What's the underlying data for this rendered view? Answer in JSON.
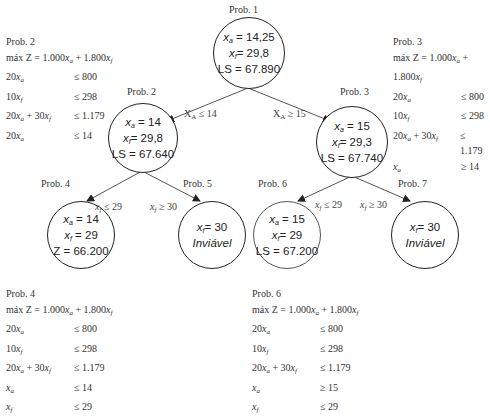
{
  "diagram": {
    "type": "branch-and-bound tree",
    "nodes": [
      {
        "id": "p1",
        "label": "Prob. 1",
        "lines": [
          "x_a = 14,25",
          "x_f = 29,8",
          "LS = 67.890"
        ]
      },
      {
        "id": "p2",
        "label": "Prob. 2",
        "lines": [
          "x_a = 14",
          "x_f = 29,8",
          "LS = 67.640"
        ]
      },
      {
        "id": "p3",
        "label": "Prob. 3",
        "lines": [
          "x_a = 15",
          "x_f = 29,3",
          "LS = 67.740"
        ]
      },
      {
        "id": "p4",
        "label": "Prob. 4",
        "lines": [
          "x_a = 14",
          "x_f = 29",
          "Z = 66.200"
        ]
      },
      {
        "id": "p5",
        "label": "Prob. 5",
        "lines": [
          "x_f = 30",
          "Inviável"
        ]
      },
      {
        "id": "p6",
        "label": "Prob. 6",
        "lines": [
          "x_a = 15",
          "x_f = 29",
          "LS = 67.200"
        ]
      },
      {
        "id": "p7",
        "label": "Prob. 7",
        "lines": [
          "x_f = 30",
          "Inviável"
        ]
      }
    ],
    "edges": [
      {
        "from": "p1",
        "to": "p2",
        "label": "X_A ≤ 14"
      },
      {
        "from": "p1",
        "to": "p3",
        "label": "X_A ≥ 15"
      },
      {
        "from": "p2",
        "to": "p4",
        "label": "x_f ≤ 29"
      },
      {
        "from": "p2",
        "to": "p5",
        "label": "x_f ≥ 30"
      },
      {
        "from": "p3",
        "to": "p6",
        "label": "x_f ≤ 29"
      },
      {
        "from": "p3",
        "to": "p7",
        "label": "x_f ≥ 30"
      }
    ]
  },
  "labels": {
    "prob1": "Prob. 1",
    "prob2": "Prob. 2",
    "prob3": "Prob. 3",
    "prob4": "Prob. 4",
    "prob5": "Prob. 5",
    "prob6": "Prob. 6",
    "prob7": "Prob. 7"
  },
  "nodes": {
    "p1": {
      "xa": "= 14,25",
      "xf": "= 29,8",
      "ls": "LS = 67.890"
    },
    "p2": {
      "xa": "= 14",
      "xf": "= 29,8",
      "ls": "LS = 67.640"
    },
    "p3": {
      "xa": "= 15",
      "xf": "= 29,3",
      "ls": "LS = 67.740"
    },
    "p4": {
      "xa": "= 14",
      "xf": "= 29",
      "ls": "Z = 66.200"
    },
    "p5": {
      "xf": "= 30",
      "status": "Inviável"
    },
    "p6": {
      "xa": "= 15",
      "xf": "= 29",
      "ls": "LS = 67.200"
    },
    "p7": {
      "xf": "= 30",
      "status": "Inviável"
    }
  },
  "edges": {
    "e12": "≤ 14",
    "e13": "≥ 15",
    "e24": "≤ 29",
    "e25": "≥ 30",
    "e36": "≤ 29",
    "e37": "≥ 30"
  },
  "models": {
    "prob2": {
      "title": "Prob. 2",
      "objective": {
        "prefix": "máx Z = 1.000",
        "mid": " + 1.800"
      },
      "constraints": [
        {
          "lhs": "20x_a",
          "rhs": "≤ 800"
        },
        {
          "lhs": "10x_f",
          "rhs": "≤ 298"
        },
        {
          "lhs": "20x_a + 30x_f",
          "rhs": "≤ 1.179"
        },
        {
          "lhs": "20x_a",
          "rhs": "≤ 14"
        }
      ],
      "rhs": [
        "≤ 800",
        "≤ 298",
        "≤ 1.179",
        "≤ 14"
      ]
    },
    "prob3": {
      "title": "Prob. 3",
      "objective": {
        "prefix": "máx Z = 1.000",
        "mid": " + 1.800"
      },
      "rhs": [
        "≤ 800",
        "≤ 298",
        "≤ 1.179",
        "≥ 14"
      ]
    },
    "prob4": {
      "title": "Prob. 4",
      "objective": {
        "prefix": "máx Z = 1.000",
        "mid": " + 1.800"
      },
      "rhs": [
        "≤ 800",
        "≤ 298",
        "≤ 1.179",
        "≤ 14",
        "≤ 29"
      ]
    },
    "prob6": {
      "title": "Prob. 6",
      "objective": {
        "prefix": "máx Z = 1.000",
        "mid": " + 1.800"
      },
      "rhs": [
        "≤ 800",
        "≤ 298",
        "≤ 1.179",
        "≥ 15",
        "≤ 29"
      ]
    }
  },
  "text": {
    "c20": "20",
    "c10": "10",
    "c30": " + 30",
    "x": "x",
    "a": "a",
    "f": "f",
    "A": "A",
    "X": "X",
    "infeasible": "Inviável"
  }
}
